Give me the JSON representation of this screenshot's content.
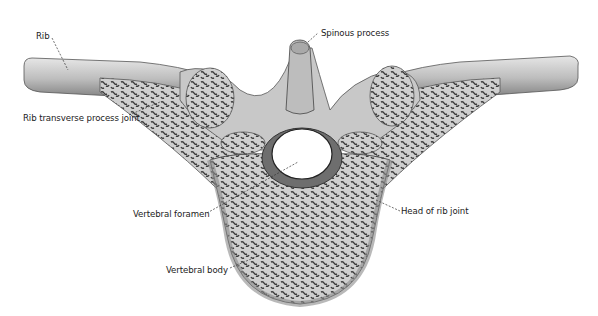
{
  "diagram": {
    "labels": [
      {
        "id": "rib",
        "text": "Rib"
      },
      {
        "id": "spinous_process",
        "text": "Spinous process"
      },
      {
        "id": "rib_transverse_process_joint",
        "text": "Rib transverse process joint"
      },
      {
        "id": "vertebral_foramen",
        "text": "Vertebral foramen"
      },
      {
        "id": "head_of_rib_joint",
        "text": "Head of rib joint"
      },
      {
        "id": "vertebral_body",
        "text": "Vertebral body"
      }
    ],
    "colors": {
      "bone_light": "#d9d9d9",
      "bone_mid": "#a8a8a8",
      "bone_dark": "#555555",
      "leader_line": "#333333",
      "background": "#ffffff"
    }
  }
}
